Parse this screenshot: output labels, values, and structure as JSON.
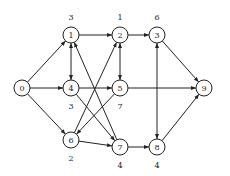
{
  "diagram": {
    "type": "directed-network",
    "node_radius": 8,
    "colors": {
      "stroke": "#222222",
      "fill": "#ffffff",
      "background": "#ffffff"
    },
    "nodes": [
      {
        "id": "0",
        "label": "0",
        "x": 22,
        "y": 88,
        "weight": "",
        "weight_pos": "none"
      },
      {
        "id": "1",
        "label": "1",
        "x": 71,
        "y": 35,
        "weight": "3",
        "weight_pos": "above"
      },
      {
        "id": "2",
        "label": "2",
        "x": 120,
        "y": 35,
        "weight": "1",
        "weight_pos": "above"
      },
      {
        "id": "3",
        "label": "3",
        "x": 157,
        "y": 35,
        "weight": "6",
        "weight_pos": "above"
      },
      {
        "id": "4",
        "label": "4",
        "x": 71,
        "y": 88,
        "weight": "3",
        "weight_pos": "below"
      },
      {
        "id": "5",
        "label": "5",
        "x": 120,
        "y": 88,
        "weight": "7",
        "weight_pos": "below"
      },
      {
        "id": "6",
        "label": "6",
        "x": 71,
        "y": 140,
        "weight": "2",
        "weight_pos": "below"
      },
      {
        "id": "7",
        "label": "7",
        "x": 120,
        "y": 147,
        "weight": "4",
        "weight_pos": "below"
      },
      {
        "id": "8",
        "label": "8",
        "x": 157,
        "y": 147,
        "weight": "4",
        "weight_pos": "below"
      },
      {
        "id": "9",
        "label": "9",
        "x": 204,
        "y": 88,
        "weight": "",
        "weight_pos": "none"
      }
    ],
    "edges": [
      {
        "from": "0",
        "to": "1",
        "bidirectional": false
      },
      {
        "from": "0",
        "to": "4",
        "bidirectional": false
      },
      {
        "from": "0",
        "to": "6",
        "bidirectional": false
      },
      {
        "from": "1",
        "to": "2",
        "bidirectional": false
      },
      {
        "from": "1",
        "to": "4",
        "bidirectional": true
      },
      {
        "from": "2",
        "to": "3",
        "bidirectional": false
      },
      {
        "from": "2",
        "to": "5",
        "bidirectional": true
      },
      {
        "from": "3",
        "to": "8",
        "bidirectional": true
      },
      {
        "from": "3",
        "to": "9",
        "bidirectional": false
      },
      {
        "from": "4",
        "to": "5",
        "bidirectional": false
      },
      {
        "from": "4",
        "to": "7",
        "bidirectional": false
      },
      {
        "from": "5",
        "to": "9",
        "bidirectional": false
      },
      {
        "from": "5",
        "to": "6",
        "bidirectional": false
      },
      {
        "from": "6",
        "to": "2",
        "bidirectional": false
      },
      {
        "from": "7",
        "to": "1",
        "bidirectional": false
      },
      {
        "from": "6",
        "to": "7",
        "bidirectional": false
      },
      {
        "from": "7",
        "to": "8",
        "bidirectional": false
      },
      {
        "from": "8",
        "to": "9",
        "bidirectional": false
      }
    ]
  }
}
